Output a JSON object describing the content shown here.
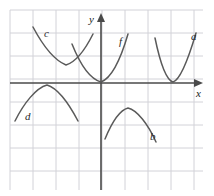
{
  "figure": {
    "type": "graph",
    "background": "#ffffff",
    "grid": {
      "visible": true,
      "color": "#d2d2d8",
      "cell_size_px": 23,
      "x_start_px": 10,
      "x_end_px": 203,
      "y_start_px": 10,
      "y_end_px": 190
    },
    "axes": {
      "color": "#4a4a4a",
      "origin_px": [
        101,
        83
      ],
      "x_axis": {
        "label": "x",
        "arrow": "right",
        "label_pos_px": [
          196,
          97
        ]
      },
      "y_axis": {
        "label": "y",
        "arrow": "up",
        "label_pos_px": [
          89,
          23
        ]
      }
    },
    "curve_color": "#5a5a5a",
    "curves": [
      {
        "id": "a",
        "label": "a",
        "shape": "parabola-up",
        "vertex": [
          3.0,
          0.0
        ],
        "label_pos_px": [
          191,
          40
        ],
        "path": "M 155 38 C 160 62, 166 80, 173 82 C 180 80, 188 60, 196 33"
      },
      {
        "id": "b",
        "label": "b",
        "shape": "parabola-down",
        "vertex": [
          0.7,
          -1.35
        ],
        "label_pos_px": [
          150,
          140
        ],
        "path": "M 105 139 C 112 122, 120 110, 128 108 C 137 110, 148 124, 156 142"
      },
      {
        "id": "c",
        "label": "c",
        "shape": "parabola-up",
        "vertex": [
          -1.55,
          1.1
        ],
        "label_pos_px": [
          44,
          37
        ],
        "path": "M 33 27 C 42 44, 54 60, 66 65 C 76 62, 86 48, 93 34"
      },
      {
        "id": "d",
        "label": "d",
        "shape": "parabola-down",
        "vertex": [
          -2.0,
          0.0
        ],
        "label_pos_px": [
          25,
          120
        ],
        "path": "M 15 121 C 24 103, 36 88, 47 85 C 57 88, 68 102, 78 121"
      },
      {
        "id": "f",
        "label": "f",
        "shape": "parabola-up",
        "vertex": [
          0.0,
          0.0
        ],
        "label_pos_px": [
          119,
          45
        ],
        "path": "M 72 44 C 80 64, 90 79, 101 82 C 112 78, 121 58, 128 34"
      }
    ]
  }
}
